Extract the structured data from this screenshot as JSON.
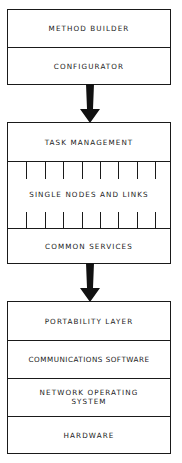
{
  "diagram": {
    "type": "layered-architecture",
    "groups": [
      {
        "id": "tools",
        "layers": [
          {
            "label": "METHOD BUILDER"
          },
          {
            "label": "CONFIGURATOR"
          }
        ]
      },
      {
        "id": "runtime",
        "layers": [
          {
            "label": "TASK MANAGEMENT"
          },
          {
            "label": "SINGLE NODES AND LINKS",
            "style": "ticked"
          },
          {
            "label": "COMMON SERVICES"
          }
        ]
      },
      {
        "id": "platform",
        "layers": [
          {
            "label": "PORTABILITY LAYER"
          },
          {
            "label": "COMMUNICATIONS SOFTWARE"
          },
          {
            "label": "NETWORK OPERATING SYSTEM",
            "lines": [
              "NETWORK OPERATING",
              "SYSTEM"
            ]
          },
          {
            "label": "HARDWARE"
          }
        ]
      }
    ],
    "connections": [
      {
        "from": "tools",
        "to": "runtime",
        "icon": "down-arrow-icon"
      },
      {
        "from": "runtime",
        "to": "platform",
        "icon": "down-arrow-icon"
      }
    ],
    "colors": {
      "stroke": "#1a1a1a",
      "background": "#ffffff"
    }
  }
}
